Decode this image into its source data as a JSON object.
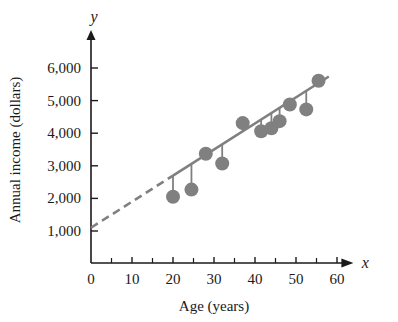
{
  "chart_data": {
    "type": "scatter",
    "title": "",
    "xlabel": "Age (years)",
    "ylabel": "Annual income (dollars)",
    "x_axis_name": "x",
    "y_axis_name": "y",
    "xlim": [
      0,
      65
    ],
    "ylim": [
      0,
      6400
    ],
    "grid": false,
    "legend": false,
    "x_ticks": [
      0,
      10,
      20,
      30,
      40,
      50,
      60
    ],
    "x_tick_labels": [
      "0",
      "10",
      "20",
      "30",
      "40",
      "50",
      "60"
    ],
    "x_minor_ticks": [
      5,
      15,
      25,
      35,
      45,
      55
    ],
    "y_ticks": [
      1000,
      2000,
      3000,
      4000,
      5000,
      6000
    ],
    "y_tick_labels": [
      "1,000",
      "2,000",
      "3,000",
      "4,000",
      "5,000",
      "6,000"
    ],
    "x": [
      20,
      24.5,
      28,
      32,
      37,
      41.5,
      44,
      46,
      48.5,
      52.5,
      55.5
    ],
    "y": [
      2050,
      2270,
      3370,
      3070,
      4310,
      4060,
      4150,
      4370,
      4880,
      4730,
      5610
    ],
    "point_color": "#808080",
    "point_radius_px": 7,
    "series": [
      {
        "name": "observations",
        "points": [
          {
            "x": 20,
            "y": 2050
          },
          {
            "x": 24.5,
            "y": 2270
          },
          {
            "x": 28,
            "y": 3370
          },
          {
            "x": 32,
            "y": 3070
          },
          {
            "x": 37,
            "y": 4310
          },
          {
            "x": 41.5,
            "y": 4060
          },
          {
            "x": 44,
            "y": 4150
          },
          {
            "x": 46,
            "y": 4370
          },
          {
            "x": 48.5,
            "y": 4880
          },
          {
            "x": 52.5,
            "y": 4730
          },
          {
            "x": 55.5,
            "y": 5610
          }
        ]
      }
    ],
    "regression_line": {
      "intercept": 1100,
      "slope": 80,
      "solid_from_x": 20,
      "solid_to_x": 58,
      "dashed_from_x": 0,
      "dashed_to_x": 20,
      "color": "#808080",
      "dash_pattern": "8 5"
    },
    "residual_lines": true
  },
  "labels": {
    "x_axis_title": "Age (years)",
    "y_axis_title": "Annual income (dollars)",
    "x_axis_letter": "x",
    "y_axis_letter": "y"
  }
}
